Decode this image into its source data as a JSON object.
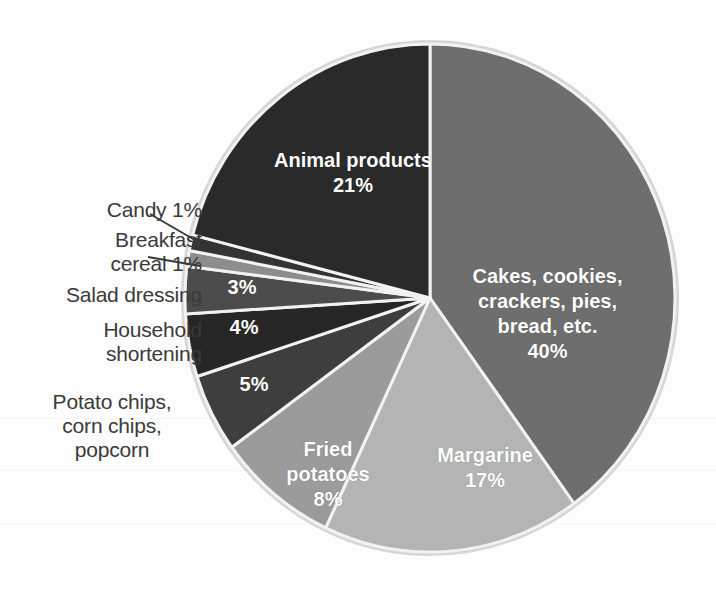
{
  "chart_data": {
    "type": "pie",
    "title": "",
    "legend_position": "none",
    "grid": false,
    "categories": [
      "Cakes, cookies, crackers, pies, bread, etc.",
      "Margarine",
      "Fried potatoes",
      "Potato chips, corn chips, popcorn",
      "Household shortening",
      "Salad dressing",
      "Breakfast cereal",
      "Candy",
      "Animal products"
    ],
    "values": [
      40,
      17,
      8,
      5,
      4,
      3,
      1,
      1,
      21
    ],
    "units": "percent",
    "slices": [
      {
        "name": "cakes",
        "label": "Cakes, cookies,\ncrackers, pies,\nbread, etc.",
        "value_label": "40%",
        "value": 40,
        "color": "#6e6e6e",
        "label_placement": "inside"
      },
      {
        "name": "margarine",
        "label": "Margarine",
        "value_label": "17%",
        "value": 17,
        "color": "#b4b4b4",
        "label_placement": "inside"
      },
      {
        "name": "fried-potatoes",
        "label": "Fried\npotatoes",
        "value_label": "8%",
        "value": 8,
        "color": "#9b9b9b",
        "label_placement": "inside"
      },
      {
        "name": "potato-chips",
        "label": "Potato chips,\ncorn chips,\npopcorn",
        "value_label": "5%",
        "value": 5,
        "color": "#3e3e3e",
        "label_placement": "callout-left"
      },
      {
        "name": "household-shortening",
        "label": "Household\nshortening",
        "value_label": "4%",
        "value": 4,
        "color": "#262626",
        "label_placement": "callout-left"
      },
      {
        "name": "salad-dressing",
        "label": "Salad dressing",
        "value_label": "3%",
        "value": 3,
        "color": "#4c4c4c",
        "label_placement": "callout-left"
      },
      {
        "name": "breakfast-cereal",
        "label": "Breakfast\ncereal 1%",
        "value_label": "1%",
        "value": 1,
        "color": "#8d8d8d",
        "label_placement": "callout-leader"
      },
      {
        "name": "candy",
        "label": "Candy 1%",
        "value_label": "1%",
        "value": 1,
        "color": "#343434",
        "label_placement": "callout-leader"
      },
      {
        "name": "animal-products",
        "label": "Animal products",
        "value_label": "21%",
        "value": 21,
        "color": "#2a2a2a",
        "label_placement": "inside"
      }
    ]
  },
  "chart": {
    "rim_color": "#d8d8d8",
    "separator_color": "#f2f2f2",
    "background": "#fdfdfd",
    "leader_line_color": "#3a3a3a"
  },
  "callouts": {
    "candy": "Candy 1%",
    "breakfast_cereal": "Breakfast\ncereal 1%",
    "salad_dressing": "Salad dressing",
    "household_shortening": "Household\nshortening",
    "potato_chips": "Potato chips,\ncorn chips,\npopcorn"
  },
  "slice_labels": {
    "animal_products": "Animal products\n21%",
    "cakes": "Cakes, cookies,\ncrackers, pies,\nbread, etc.\n40%",
    "margarine": "Margarine\n17%",
    "fried_potatoes": "Fried\npotatoes\n8%",
    "potato_chips_pct": "5%",
    "household_shortening_pct": "4%",
    "salad_dressing_pct": "3%"
  }
}
